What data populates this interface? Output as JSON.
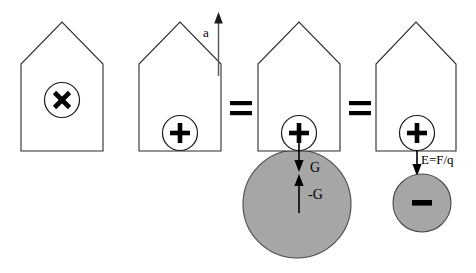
{
  "figure": {
    "background_color": "#ffffff",
    "outline_color": "#2b2b2b",
    "body_fill_color": "#a6a6a6",
    "glyph_color": "#000000",
    "width": 476,
    "height": 273
  },
  "panels": [
    {
      "id": "panel-1",
      "name": "house-rest-frame",
      "charge_symbol": "×",
      "charge_symbol_name": "cross-times-symbol",
      "has_acceleration_arrow": false,
      "has_body": false
    },
    {
      "id": "panel-2",
      "name": "house-accelerating",
      "charge_symbol": "+",
      "charge_symbol_name": "plus-symbol",
      "has_acceleration_arrow": true,
      "acceleration_label": "a",
      "has_body": false
    },
    {
      "id": "panel-3",
      "name": "house-gravitational-field",
      "charge_symbol": "+",
      "charge_symbol_name": "plus-symbol",
      "has_acceleration_arrow": false,
      "has_body": true,
      "body_name": "large-grey-mass",
      "body_symbol": "",
      "force_down_label": "G",
      "force_up_label": "-G"
    },
    {
      "id": "panel-4",
      "name": "house-electric-field",
      "charge_symbol": "+",
      "charge_symbol_name": "plus-symbol",
      "has_acceleration_arrow": false,
      "has_body": true,
      "body_name": "small-grey-charge",
      "body_symbol": "−",
      "body_symbol_name": "minus-symbol",
      "field_label": "E=F/q"
    }
  ],
  "operators": [
    {
      "id": "equals-1",
      "name": "equals-sign-first",
      "symbol": "="
    },
    {
      "id": "equals-2",
      "name": "equals-sign-second",
      "symbol": "="
    }
  ],
  "labels": {
    "acceleration": "a",
    "gravity_down": "G",
    "gravity_up": "-G",
    "electric_field": "E=F/q",
    "charge_cross": "×",
    "charge_plus": "+",
    "charge_minus": "−"
  }
}
